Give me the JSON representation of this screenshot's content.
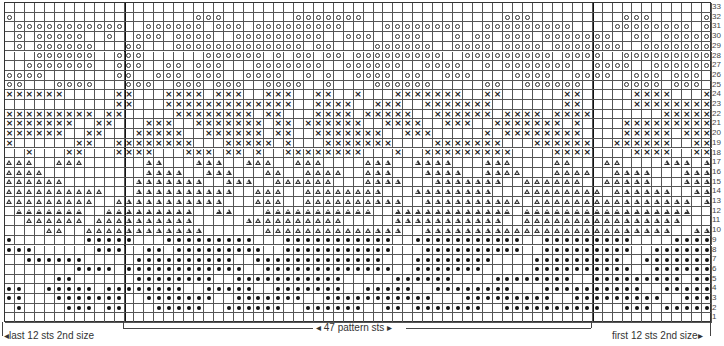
{
  "chart": {
    "columns": 71,
    "rows": 33,
    "dividers_after_columns": [
      12,
      59
    ],
    "legend_symbols": {
      ".": "empty",
      "o": "circle",
      "x": "cross",
      "t": "triangle",
      "*": "dot"
    },
    "row_numbers": [
      "33",
      "32",
      "31",
      "30",
      "29",
      "28",
      "27",
      "26",
      "25",
      "24",
      "23",
      "22",
      "21",
      "20",
      "19",
      "18",
      "17",
      "17b",
      "16",
      "15",
      "14",
      "13",
      "12",
      "11",
      "10",
      "9",
      "8",
      "7",
      "6",
      "5",
      "4",
      "3",
      "2",
      "1"
    ],
    "grid_rows": [
      ".......................................................................",
      "o..................ooo.......ooooooo..............ooo.........ooo.....o",
      ".ooooooooooo..oooooo.ooo.ooooooooo....oooooooo..ooooooooo....oooooooo.o",
      ".o.ooooo..o..ooo.oooo..ooooooooo..ooo..ooo...o.oo.ooo.ooooooo..oo.ooooo",
      ".o.oooooo...oo...ooooooooooooo.oo....oooooo..oooo.oooo.ooooooo..ooooooo",
      "...oooooo..ooo......oooooo.o.oo.oo.ooooooooo..ooooooooo.oooo..ooooooooo",
      "..ooooooo..ooo..oo.ooo...ooooooo..oooooo..oooo..o.ooooooo..oooo..oooooo",
      "oooo.......oo..ooo.ooo..oooo..o.o..oooo.oo..ooo....oooo..oooo..ooo.ooo.",
      "oo...oooo...ooo..ooo.ooo..oooo..o....oooooo.....oo..oooooo....oooo.ooo.",
      "xxxxxx.....xx...xxxx.xxx..xxx..xx..x...xxxxxxx..xx......xx.....xxxx...x",
      "...........xx...xxxxxxxxxxxxx..xxxx..xxx..xxxxxxx.......xx.....xxxxxxxx",
      "xxxxxxxxx.xx.....xxxxxxxx.xx...xxxx.xxxxx..xxxxxx.xxxx.xxxx.......xxxxx",
      "xxxxxxx..xx...xxx..xxxxxxx.xx.xxxxxx..xxxx..xxx..xxxxxxx.x....xxxxxxxxx",
      "xxxxxx..xx...xxxxx..xxxxxx.xx..xxxxxxx..xxx.....x.xxxxxxxx....xxxxx.xxx",
      "x......xx..xxxxxxxx...xxxxx.x...xxxxxxx....xxxxxxx...xxxxxx..xxxxxx..xx",
      "..x...xx...xxxx...xxx.xx.x..xxxxxxxx...x..xxxxxxxxx....xxxx....xxxx..xx",
      "ttt..ttt......tt...ttt..ttt..ttt....ttt..tttt...ttt....tt...tt....ttt.t",
      "tttt..........tttt..ttt...tt..tttt..ttt...tttt..tttt...tttt..tttt...ttt",
      "tttttt.......ttttttt..ttt..tttttt...tttt...ttttttt..tttttt..ttttt...ttt",
      "tttttttttt...tttttttttt..ttt..tttttttt...tttttttt...tttttttt.tttttt..ttt",
      "ttttttttt..ttttttttttt...ttt..tttttttttt..tttttttttt.tttttttttttttttt.tt",
      ".ttttttt..ttttttttt..tt...ttttttttttt..tttttttttttt.ttttttttttttttttt..",
      "..tttttt.tttttttttt.....tttttttttt.....ttttttttttt..tttttttttttttttt....",
      "....tt..tttttttttttt......tttttttttttttt..ttttttttttttttttttttttttt..tttt",
      "*.......*****...*********...***********..***********..*********....*********.",
      "***......***..**.*********..***********...**********..*********..**********..*",
      "..******.....**********..*************...********....*********..**********..*",
      ".......****.************..*************..*******.....**********..********..*",
      ".....**......********..***********.....******....********..*********.********",
      "**..*****.********..*****..*******..*****..********...**********..**********",
      "**...*******..*******..*******..***********...*********..*********..********",
      ".*....***.**...*****..******..******..**.*******..**********..***.********",
      "......................................................................."
    ]
  },
  "labels": {
    "left": "last 12 sts 2nd size",
    "middle": "47 pattern sts",
    "right": "first 12 sts 2nd size"
  },
  "row_labels": [
    "33",
    "32",
    "31",
    "30",
    "29",
    "28",
    "27",
    "26",
    "25",
    "24",
    "23",
    "22",
    "21",
    "20",
    "19",
    "18",
    "17",
    "16",
    "15",
    "14",
    "13",
    "12",
    "11",
    "10",
    "9",
    "8",
    "7",
    "6",
    "5",
    "4",
    "3",
    "2",
    "1"
  ]
}
